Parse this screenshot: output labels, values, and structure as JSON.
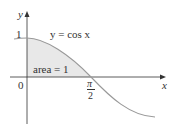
{
  "diagram": {
    "equation_label": "y = cos x",
    "area_label": "area = 1",
    "y_axis_label": "y",
    "x_axis_label": "x",
    "y_tick_label": "1",
    "origin_label": "0",
    "x_tick_label_num": "π",
    "x_tick_label_den": "2",
    "colors": {
      "curve": "#999999",
      "fill": "#e6e6e6",
      "axis": "#333333"
    }
  }
}
